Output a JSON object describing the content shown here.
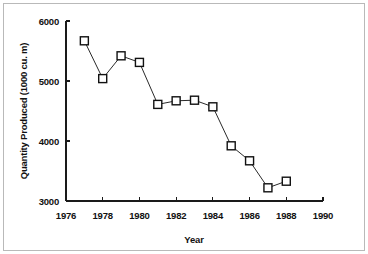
{
  "chart_data": {
    "type": "line",
    "title": "",
    "xlabel": "Year",
    "ylabel": "Quantity Produced (1000 cu. m)",
    "xlim": [
      1976,
      1990
    ],
    "ylim": [
      3000,
      6000
    ],
    "xticks": [
      1976,
      1978,
      1980,
      1982,
      1984,
      1986,
      1988,
      1990
    ],
    "yticks": [
      3000,
      4000,
      5000,
      6000
    ],
    "xtick_labels": [
      "1976",
      "1978",
      "1980",
      "1982",
      "1984",
      "1986",
      "1988",
      "1990"
    ],
    "ytick_labels": [
      "3000",
      "4000",
      "5000",
      "6000"
    ],
    "grid": false,
    "legend": "none",
    "marker": "open-square",
    "x": [
      1977,
      1978,
      1979,
      1980,
      1981,
      1982,
      1983,
      1984,
      1985,
      1986,
      1987,
      1988
    ],
    "values": [
      5670,
      5040,
      5420,
      5310,
      4610,
      4670,
      4680,
      4570,
      3920,
      3670,
      3220,
      3330
    ],
    "series": [
      {
        "name": "Quantity Produced",
        "x": [
          1977,
          1978,
          1979,
          1980,
          1981,
          1982,
          1983,
          1984,
          1985,
          1986,
          1987,
          1988
        ],
        "values": [
          5670,
          5040,
          5420,
          5310,
          4610,
          4670,
          4680,
          4570,
          3920,
          3670,
          3220,
          3330
        ]
      }
    ],
    "line_color": "#2a2a2a",
    "marker_fill": "#ffffff",
    "marker_edge": "#111111"
  },
  "figure": {
    "border_color": "#b9b9b9",
    "background": "#ffffff"
  }
}
